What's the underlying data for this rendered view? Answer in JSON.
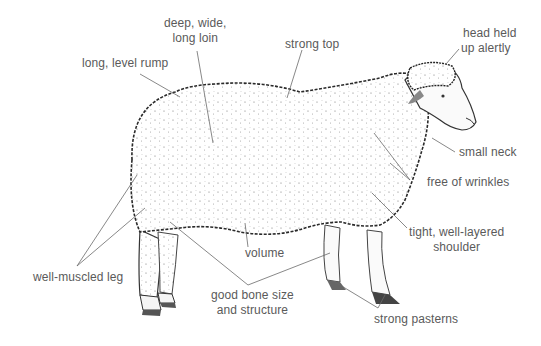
{
  "diagram": {
    "colors": {
      "label_text": "#5a5a5a",
      "leader_line": "#6a6a6a",
      "fleece_outline": "#222222",
      "background": "#ffffff"
    },
    "labels": [
      {
        "id": "loin",
        "line1": "deep, wide,",
        "line2": "long loin"
      },
      {
        "id": "rump",
        "line1": "long, level rump"
      },
      {
        "id": "top",
        "line1": "strong top"
      },
      {
        "id": "head",
        "line1": "head held",
        "line2": "up alertly"
      },
      {
        "id": "neck",
        "line1": "small neck"
      },
      {
        "id": "wrinkles",
        "line1": "free of wrinkles"
      },
      {
        "id": "shoulder",
        "line1": "tight, well-layered",
        "line2": "shoulder"
      },
      {
        "id": "volume",
        "line1": "volume"
      },
      {
        "id": "leg",
        "line1": "well-muscled leg"
      },
      {
        "id": "bone",
        "line1": "good bone size",
        "line2": "and structure"
      },
      {
        "id": "pasterns",
        "line1": "strong pasterns"
      }
    ]
  }
}
